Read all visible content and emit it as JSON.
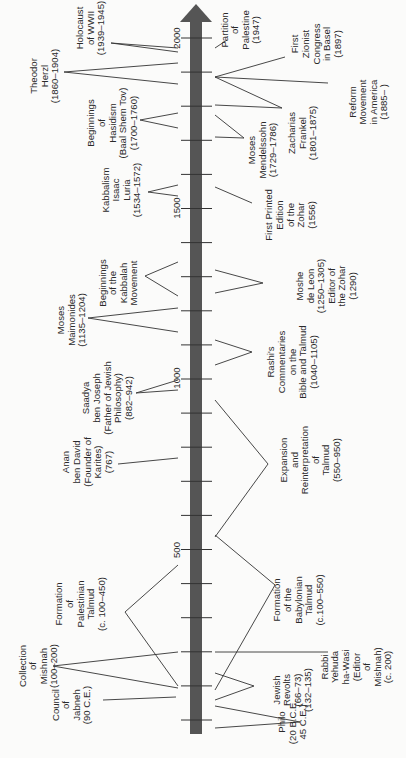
{
  "axis": {
    "color": "#555555",
    "tick_labels": [
      {
        "text": "2000",
        "year": 2000
      },
      {
        "text": "1500",
        "year": 1500
      },
      {
        "text": "1000",
        "year": 1000
      },
      {
        "text": "500",
        "year": 500
      }
    ]
  },
  "left_events": [
    {
      "id": "holocaust",
      "lines": [
        "Holocaust",
        "of WWII",
        "(1939–1945)"
      ]
    },
    {
      "id": "herzl",
      "lines": [
        "Theodor",
        "Herzl",
        "(1860–1904)"
      ]
    },
    {
      "id": "hasidism",
      "lines": [
        "Beginnings",
        "of",
        "Hasidism",
        "(Baal Shem Tov)",
        "(1700–1760)"
      ]
    },
    {
      "id": "luria",
      "lines": [
        "Kabbalism",
        "Isaac",
        "Luria",
        "(1534–1572)"
      ]
    },
    {
      "id": "kabbalah",
      "lines": [
        "Beginnings",
        "of the",
        "Kabbalah",
        "Movement"
      ]
    },
    {
      "id": "maimonides",
      "lines": [
        "Moses",
        "Maimonides",
        "(1135–1204)"
      ]
    },
    {
      "id": "saadya",
      "lines": [
        "Saadya",
        "ben Joseph",
        "(Father of Jewish",
        "Philosophy)",
        "(882–942)"
      ]
    },
    {
      "id": "anan",
      "lines": [
        "Anan",
        "ben David",
        "(Founder of",
        "Karites)",
        "(767)"
      ]
    },
    {
      "id": "palestinian-talmud",
      "lines": [
        "Formation",
        "of",
        "Palestinian",
        "Talmud",
        "(c. 100–450)"
      ]
    },
    {
      "id": "mishnah",
      "lines": [
        "Collection",
        "of",
        "Mishnah",
        "(100–200)"
      ]
    },
    {
      "id": "jabneh",
      "lines": [
        "Council",
        "of",
        "Jabneh",
        "(90 C.E.)"
      ]
    }
  ],
  "right_events": [
    {
      "id": "partition",
      "lines": [
        "Partition",
        "of",
        "Palestine",
        "(1947)"
      ]
    },
    {
      "id": "zionist-congress",
      "lines": [
        "First",
        "Zionist",
        "Congress",
        "in Basel",
        "(1897)"
      ]
    },
    {
      "id": "reform",
      "lines": [
        "Reform",
        "Movement",
        "in America",
        "(1885–  )"
      ]
    },
    {
      "id": "frankel",
      "lines": [
        "Zacharias",
        "Frankel",
        "(1801–1875)"
      ]
    },
    {
      "id": "mendelssohn",
      "lines": [
        "Moses",
        "Mendelssohn",
        "(1729–1786)"
      ]
    },
    {
      "id": "zohar-print",
      "lines": [
        "First Printed",
        "Edition",
        "of the",
        "Zohar",
        "(1556)"
      ]
    },
    {
      "id": "de-leon",
      "lines": [
        "Moshe",
        "de Leon",
        "(1250–1305)",
        "Editor of",
        "the Zohar",
        "(1290)"
      ]
    },
    {
      "id": "rashi",
      "lines": [
        "Rashi's",
        "Commentaries",
        "on the",
        "Bible and Talmud",
        "(1040–1105)"
      ]
    },
    {
      "id": "expansion",
      "lines": [
        "Expansion",
        "and",
        "Reinterpretation",
        "of",
        "Talmud",
        "(550–950)"
      ]
    },
    {
      "id": "babylonian-talmud",
      "lines": [
        "Formation",
        "of the",
        "Babylonian",
        "Talmud",
        "(c.100–550)"
      ]
    },
    {
      "id": "yehuda",
      "lines": [
        "Rabbi",
        "Yehuda",
        "ha-Wasi",
        "(Editor",
        "of",
        "Mishnah)",
        "(c. 200)"
      ]
    },
    {
      "id": "revolts",
      "lines": [
        "Jewish",
        "Revolts",
        "(66–73)",
        "(132–135)"
      ]
    },
    {
      "id": "philo",
      "lines": [
        "Philo",
        "(20 B.C.E.",
        "45 C.E.)"
      ]
    }
  ]
}
